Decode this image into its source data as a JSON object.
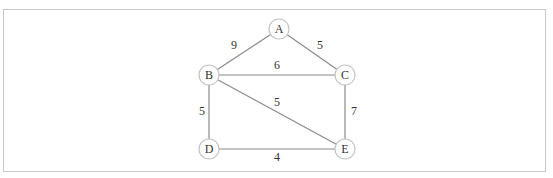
{
  "diagram": {
    "type": "weighted-undirected-graph",
    "colors": {
      "edge": "#8a8a8a",
      "node_stroke": "#c4c4c4",
      "text": "#333333",
      "frame": "#c8c8c8"
    },
    "nodes": [
      {
        "id": "A",
        "label": "A",
        "x": 279,
        "y": 29
      },
      {
        "id": "B",
        "label": "B",
        "x": 209,
        "y": 75
      },
      {
        "id": "C",
        "label": "C",
        "x": 345,
        "y": 75
      },
      {
        "id": "D",
        "label": "D",
        "x": 209,
        "y": 149
      },
      {
        "id": "E",
        "label": "E",
        "x": 345,
        "y": 149
      }
    ],
    "edges": [
      {
        "from": "A",
        "to": "B",
        "weight": "9",
        "label_x": 234,
        "label_y": 45
      },
      {
        "from": "A",
        "to": "C",
        "weight": "5",
        "label_x": 320,
        "label_y": 45
      },
      {
        "from": "B",
        "to": "C",
        "weight": "6",
        "label_x": 277,
        "label_y": 65
      },
      {
        "from": "B",
        "to": "D",
        "weight": "5",
        "label_x": 202,
        "label_y": 111
      },
      {
        "from": "B",
        "to": "E",
        "weight": "5",
        "label_x": 277,
        "label_y": 102
      },
      {
        "from": "C",
        "to": "E",
        "weight": "7",
        "label_x": 354,
        "label_y": 111
      },
      {
        "from": "D",
        "to": "E",
        "weight": "4",
        "label_x": 277,
        "label_y": 157
      }
    ]
  }
}
